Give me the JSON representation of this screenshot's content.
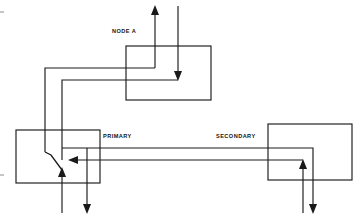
{
  "diagram": {
    "background_color": "#ffffff",
    "line_color": "#1a1a1a",
    "canvas": {
      "width": 361,
      "height": 224
    },
    "labels": {
      "node_a": "NODE A",
      "primary": "PRIMARY",
      "secondary": "SECONDARY"
    },
    "blocks": [
      {
        "id": "node-a",
        "label": "NODE A",
        "x": 126,
        "y": 46,
        "width": 85,
        "height": 54,
        "label_x": 112,
        "label_y": 33
      },
      {
        "id": "primary",
        "label": "PRIMARY",
        "x": 16,
        "y": 130,
        "width": 84,
        "height": 53,
        "label_x": 103,
        "label_y": 138
      },
      {
        "id": "secondary",
        "label": "SECONDARY",
        "x": 268,
        "y": 124,
        "width": 84,
        "height": 56,
        "label_x": 216,
        "label_y": 138
      }
    ],
    "wires": [
      {
        "id": "primary-out-to-node-a-up",
        "description": "From primary block area left, up and across, then up out of node A top",
        "path": "M 99 68 L 45 68 L 45 152"
      },
      {
        "id": "node-a-up-riser",
        "description": "Riser rising out of top of node A with up arrow",
        "path": "M 155 72 L 155 6"
      },
      {
        "id": "node-a-upper-feed",
        "description": "Upper horizontal feed into node A turning up at riser",
        "path": "M 45 68 L 155 68 L 155 72"
      },
      {
        "id": "node-a-lower-feed",
        "description": "Lower horizontal feed into node A ending in a down arrow",
        "path": "M 62 80 L 178 80"
      },
      {
        "id": "node-a-down-riser",
        "description": "Riser entering node A from top right, terminating in down arrow",
        "path": "M 178 6 L 178 80"
      },
      {
        "id": "left-inner-riser",
        "description": "Inner left riser down into primary block",
        "path": "M 62 80 L 62 160"
      },
      {
        "id": "secondary-to-primary-upper",
        "description": "Upper long horizontal tie from secondary down-leg to primary area",
        "path": "M 62 148 L 313 148 L 313 213"
      },
      {
        "id": "secondary-to-primary-lower",
        "description": "Lower long horizontal return into primary with left arrow",
        "path": "M 303 160 L 70 160"
      },
      {
        "id": "secondary-up-leg",
        "description": "Riser up into secondary block bottom with up arrow",
        "path": "M 303 213 L 303 160"
      },
      {
        "id": "primary-down-leg",
        "description": "Leg dropping out of primary bottom with down arrow",
        "path": "M 87 148 L 87 213"
      },
      {
        "id": "primary-up-leg",
        "description": "Leg rising into primary bottom with up arrow",
        "path": "M 62 213 L 62 168"
      },
      {
        "id": "switch-contact",
        "description": "Diagonal switch contact arm inside primary block",
        "path": "M 45 152 L 50 154 L 62 168"
      }
    ],
    "arrowheads": [
      {
        "id": "node-a-top-up-arrow",
        "x": 155,
        "y": 6,
        "direction": "up"
      },
      {
        "id": "node-a-down-arrow",
        "x": 178,
        "y": 80,
        "direction": "down"
      },
      {
        "id": "primary-left-arrow",
        "x": 70,
        "y": 160,
        "direction": "left"
      },
      {
        "id": "primary-up-arrow",
        "x": 62,
        "y": 168,
        "direction": "up"
      },
      {
        "id": "primary-down-arrow",
        "x": 87,
        "y": 213,
        "direction": "down"
      },
      {
        "id": "secondary-up-arrow",
        "x": 303,
        "y": 160,
        "direction": "up"
      },
      {
        "id": "secondary-down-arrow",
        "x": 313,
        "y": 213,
        "direction": "down"
      }
    ]
  }
}
